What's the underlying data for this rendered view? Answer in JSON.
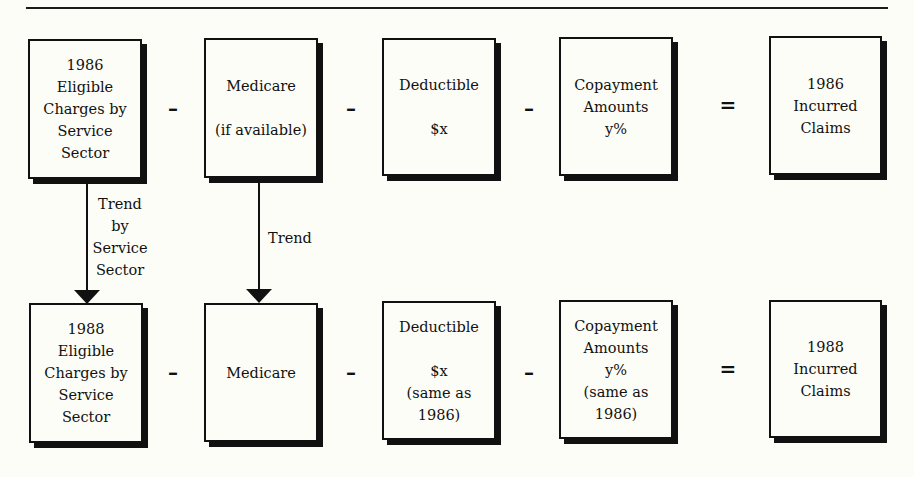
{
  "diagram": {
    "row1": {
      "eligible": {
        "lines": [
          "1986",
          "Eligible",
          "Charges by",
          "Service",
          "Sector"
        ]
      },
      "medicare": {
        "lines": [
          "Medicare",
          "(if available)"
        ]
      },
      "deductible": {
        "lines": [
          "Deductible",
          "$x"
        ]
      },
      "copayment": {
        "lines": [
          "Copayment",
          "Amounts",
          "y%"
        ]
      },
      "claims": {
        "lines": [
          "1986",
          "Incurred",
          "Claims"
        ]
      }
    },
    "row2": {
      "eligible": {
        "lines": [
          "1988",
          "Eligible",
          "Charges by",
          "Service",
          "Sector"
        ]
      },
      "medicare": {
        "lines": [
          "Medicare"
        ]
      },
      "deductible": {
        "lines": [
          "Deductible",
          "$x",
          "(same as",
          "1986)"
        ]
      },
      "copayment": {
        "lines": [
          "Copayment",
          "Amounts",
          "y%",
          "(same as",
          "1986)"
        ]
      },
      "claims": {
        "lines": [
          "1988",
          "Incurred",
          "Claims"
        ]
      }
    },
    "operators": {
      "minus": "–",
      "equals": "="
    },
    "arrows": {
      "trend_by_sector": {
        "lines": [
          "Trend",
          "by",
          "Service",
          "Sector"
        ]
      },
      "trend": {
        "lines": [
          "Trend"
        ]
      }
    }
  }
}
